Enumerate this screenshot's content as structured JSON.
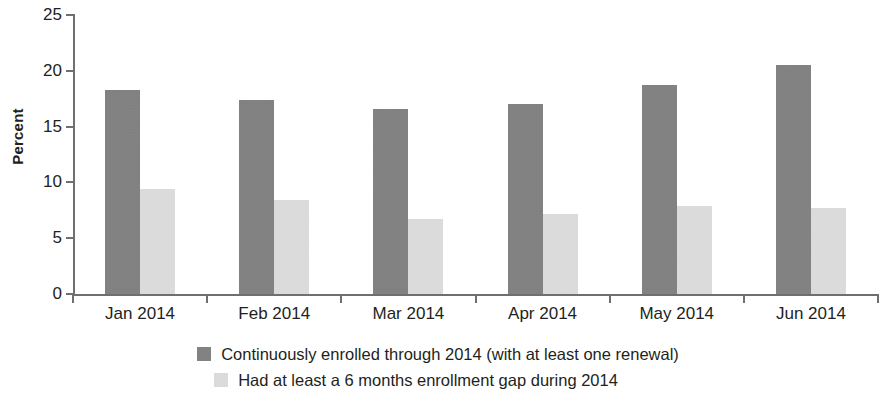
{
  "chart_data": {
    "type": "bar",
    "title": "",
    "xlabel": "",
    "ylabel": "Percent",
    "ylim": [
      0,
      25
    ],
    "yticks": [
      0,
      5,
      10,
      15,
      20,
      25
    ],
    "ytick_labels": [
      "0",
      "5",
      "10",
      "15",
      "20",
      "25"
    ],
    "grid": false,
    "legend_position": "bottom",
    "categories": [
      "Jan 2014",
      "Feb 2014",
      "Mar 2014",
      "Apr 2014",
      "May 2014",
      "Jun 2014"
    ],
    "series": [
      {
        "name": "Continuously enrolled through 2014 (with at least one renewal)",
        "color": "#828282",
        "values": [
          18.3,
          17.4,
          16.6,
          17.0,
          18.7,
          20.5
        ]
      },
      {
        "name": "Had at least a 6 months enrollment gap during 2014",
        "color": "#d9d9d9",
        "values": [
          9.4,
          8.4,
          6.7,
          7.2,
          7.9,
          7.7
        ]
      }
    ]
  },
  "axis": {
    "y_title": "Percent",
    "axis_color": "#6f6f6f"
  },
  "legend": {
    "entries": [
      {
        "label": "Continuously enrolled through 2014 (with at least one renewal)",
        "swatch": "legend-swatch-dark"
      },
      {
        "label": "Had at least a 6 months enrollment gap during 2014",
        "swatch": "legend-swatch-light"
      }
    ]
  }
}
